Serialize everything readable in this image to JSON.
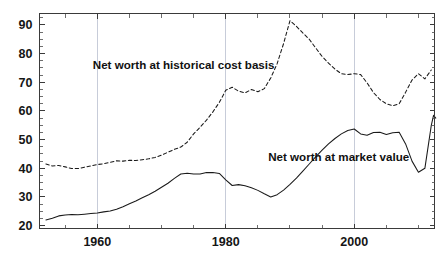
{
  "chart_data": {
    "type": "line",
    "title": "",
    "subtitle": "",
    "xlabel": "",
    "ylabel": "",
    "xlim": [
      1951,
      2012.5
    ],
    "ylim": [
      19,
      94
    ],
    "grid": "vertical gridlines at 1960, 1980, 2000",
    "legend_position": "inline annotations on plot",
    "x_ticks_major": [
      1960,
      1980,
      2000
    ],
    "x_tick_labels": [
      "1960",
      "1980",
      "2000"
    ],
    "x_ticks_minor": [
      1955,
      1965,
      1970,
      1975,
      1985,
      1990,
      1995,
      2005,
      2010
    ],
    "y_ticks": [
      20,
      30,
      40,
      50,
      60,
      70,
      80,
      90
    ],
    "y_tick_labels": [
      "20",
      "30",
      "40",
      "50",
      "60",
      "70",
      "80",
      "90"
    ],
    "y_ticks_minor_step": 2.5,
    "annotations": [
      {
        "text": "Net worth at historical cost basis",
        "x": 1959.3,
        "y": 74.5
      },
      {
        "text": "Net worth at market value",
        "x": 1986.6,
        "y": 42.6
      }
    ],
    "series": [
      {
        "name": "Net worth at historical cost basis",
        "style": "dashed",
        "color": "#1a1a1a",
        "x": [
          1952,
          1953,
          1954,
          1955,
          1956,
          1957,
          1958,
          1959,
          1960,
          1961,
          1962,
          1963,
          1964,
          1965,
          1966,
          1967,
          1968,
          1969,
          1970,
          1971,
          1972,
          1973,
          1974,
          1975,
          1976,
          1977,
          1978,
          1979,
          1980,
          1981,
          1982,
          1983,
          1984,
          1985,
          1986,
          1987,
          1988,
          1989,
          1990,
          1991,
          1992,
          1993,
          1994,
          1995,
          1996,
          1997,
          1998,
          1999,
          2000,
          2001,
          2002,
          2003,
          2004,
          2005,
          2006,
          2007,
          2008,
          2009,
          2010,
          2011,
          2012
        ],
        "values": [
          41.5,
          40.8,
          41.0,
          40.5,
          39.9,
          39.9,
          40.4,
          40.8,
          41.3,
          41.6,
          42.1,
          42.6,
          42.5,
          42.8,
          42.7,
          43.0,
          43.3,
          43.8,
          44.6,
          45.6,
          46.6,
          47.4,
          49.1,
          52.0,
          54.3,
          56.8,
          59.7,
          63.0,
          67.2,
          68.3,
          66.9,
          66.3,
          67.5,
          66.7,
          67.8,
          71.5,
          76.5,
          83.5,
          91.5,
          89.5,
          87.2,
          85.0,
          82.0,
          79.0,
          76.7,
          74.6,
          73.0,
          72.7,
          73.0,
          72.7,
          69.8,
          66.4,
          64.0,
          62.5,
          61.8,
          62.5,
          66.5,
          70.8,
          73.0,
          71.2,
          74.3
        ]
      },
      {
        "name": "Net worth at market value",
        "style": "solid",
        "color": "#1a1a1a",
        "x": [
          1952,
          1953,
          1954,
          1955,
          1956,
          1957,
          1958,
          1959,
          1960,
          1961,
          1962,
          1963,
          1964,
          1965,
          1966,
          1967,
          1968,
          1969,
          1970,
          1971,
          1972,
          1973,
          1974,
          1975,
          1976,
          1977,
          1978,
          1979,
          1980,
          1981,
          1982,
          1983,
          1984,
          1985,
          1986,
          1987,
          1988,
          1989,
          1990,
          1991,
          1992,
          1993,
          1994,
          1995,
          1996,
          1997,
          1998,
          1999,
          2000,
          2001,
          2002,
          2003,
          2004,
          2005,
          2006,
          2007,
          2008,
          2009,
          2010,
          2011,
          2012
        ],
        "values": [
          22.0,
          22.6,
          23.4,
          23.7,
          23.9,
          23.8,
          24.0,
          24.2,
          24.4,
          24.8,
          25.1,
          25.7,
          26.6,
          27.6,
          28.6,
          29.7,
          30.8,
          32.0,
          33.4,
          34.8,
          36.5,
          38.0,
          38.3,
          38.0,
          38.0,
          38.5,
          38.5,
          38.2,
          36.0,
          34.0,
          34.3,
          33.9,
          33.2,
          32.3,
          31.1,
          30.0,
          30.8,
          32.4,
          34.4,
          36.6,
          39.0,
          41.5,
          44.0,
          46.3,
          48.5,
          50.4,
          52.0,
          53.2,
          53.7,
          52.0,
          51.5,
          52.5,
          52.6,
          51.8,
          52.4,
          52.6,
          48.5,
          42.5,
          38.6,
          40.0,
          55.0
        ],
        "value_end_points": [
          38.8,
          58.5,
          57.5
        ]
      }
    ]
  },
  "axes": {
    "y_axis_name": "vertical-value-axis",
    "x_axis_name": "horizontal-year-axis"
  }
}
